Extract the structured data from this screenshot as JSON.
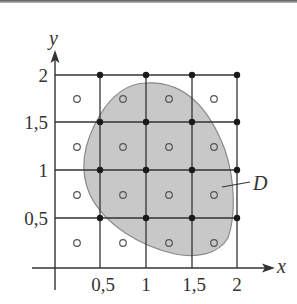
{
  "figure": {
    "type": "double-integral-riemann-grid",
    "axes": {
      "x_label": "x",
      "y_label": "y",
      "x_ticks": [
        "0,5",
        "1",
        "1,5",
        "2"
      ],
      "y_ticks": [
        "0,5",
        "1",
        "1,5",
        "2"
      ],
      "x_range": [
        0,
        2
      ],
      "y_range": [
        0,
        2
      ]
    },
    "region_label": "D",
    "grid": {
      "step": 0.5,
      "rows": 4,
      "cols": 4
    },
    "colors": {
      "lines": "#333333",
      "region_fill": "#c8c8c8",
      "region_stroke": "#8a8a8a",
      "dots": "#1a1a1a",
      "sample_points": "#555555"
    },
    "lattice_dots_note": "filled dots at grid intersections x,y in {0.5,1,1.5,2}",
    "sample_points_note": "open circles at cell centers x,y in {0.25,0.75,1.25,1.75}"
  }
}
